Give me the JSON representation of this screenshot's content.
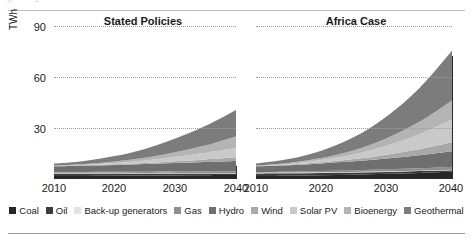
{
  "figure": {
    "ylabel": "TWh",
    "ghost_text": "Figure fragment"
  },
  "legend": {
    "items": [
      {
        "label": "Coal",
        "color": "#262626"
      },
      {
        "label": "Oil",
        "color": "#3d3d3d"
      },
      {
        "label": "Back-up generators",
        "color": "#e2e2e2"
      },
      {
        "label": "Gas",
        "color": "#8e8e8e"
      },
      {
        "label": "Hydro",
        "color": "#6f6f6f"
      },
      {
        "label": "Wind",
        "color": "#a8a8a8"
      },
      {
        "label": "Solar PV",
        "color": "#c9c9c9"
      },
      {
        "label": "Bioenergy",
        "color": "#b4b4b4"
      },
      {
        "label": "Geothermal",
        "color": "#7c7c7c"
      }
    ]
  },
  "chart_data": {
    "type": "area",
    "title": "",
    "xlabel": "",
    "ylabel": "TWh",
    "ylim": [
      0,
      95
    ],
    "yticks": [
      30,
      60,
      90
    ],
    "grid": true,
    "legend_position": "bottom",
    "x": [
      2010,
      2015,
      2020,
      2025,
      2030,
      2035,
      2040
    ],
    "xticks": [
      2010,
      2020,
      2030,
      2040
    ],
    "panels": [
      {
        "name": "Stated Policies",
        "series": [
          {
            "name": "Coal",
            "values": [
              1.2,
              1.3,
              1.4,
              1.5,
              1.6,
              1.7,
              1.8
            ]
          },
          {
            "name": "Oil",
            "values": [
              1.6,
              1.5,
              1.4,
              1.3,
              1.2,
              1.1,
              1.0
            ]
          },
          {
            "name": "Back-up generators",
            "values": [
              0.5,
              0.5,
              0.5,
              0.4,
              0.4,
              0.3,
              0.3
            ]
          },
          {
            "name": "Gas",
            "values": [
              0.4,
              0.5,
              0.6,
              0.7,
              0.8,
              0.9,
              1.0
            ]
          },
          {
            "name": "Hydro",
            "values": [
              3.6,
              3.9,
              4.3,
              4.8,
              5.4,
              6.0,
              6.6
            ]
          },
          {
            "name": "Wind",
            "values": [
              0.1,
              0.2,
              0.4,
              0.7,
              1.1,
              1.6,
              2.2
            ]
          },
          {
            "name": "Solar PV",
            "values": [
              0.1,
              0.3,
              0.8,
              1.6,
              2.8,
              4.2,
              6.0
            ]
          },
          {
            "name": "Bioenergy",
            "values": [
              0.3,
              0.5,
              0.9,
              1.6,
              2.8,
              4.6,
              7.1
            ]
          },
          {
            "name": "Geothermal",
            "values": [
              1.2,
              2.0,
              3.4,
              5.6,
              8.6,
              12.2,
              16.5
            ]
          }
        ],
        "total_2010": 9.0,
        "total_2040": 42.5
      },
      {
        "name": "Africa Case",
        "series": [
          {
            "name": "Coal",
            "values": [
              1.2,
              1.4,
              1.7,
              2.1,
              2.6,
              3.2,
              3.9
            ]
          },
          {
            "name": "Oil",
            "values": [
              1.6,
              1.5,
              1.4,
              1.3,
              1.2,
              1.1,
              1.0
            ]
          },
          {
            "name": "Back-up generators",
            "values": [
              0.5,
              0.5,
              0.5,
              0.4,
              0.4,
              0.3,
              0.3
            ]
          },
          {
            "name": "Gas",
            "values": [
              0.4,
              0.5,
              0.7,
              0.9,
              1.2,
              1.5,
              1.9
            ]
          },
          {
            "name": "Hydro",
            "values": [
              3.6,
              4.1,
              4.8,
              5.7,
              6.8,
              8.1,
              9.6
            ]
          },
          {
            "name": "Wind",
            "values": [
              0.1,
              0.3,
              0.7,
              1.4,
              2.4,
              3.8,
              5.6
            ]
          },
          {
            "name": "Solar PV",
            "values": [
              0.1,
              0.5,
              1.4,
              3.0,
              5.6,
              9.3,
              14.2
            ]
          },
          {
            "name": "Bioenergy",
            "values": [
              0.3,
              0.6,
              1.3,
              2.6,
              4.7,
              7.8,
              12.0
            ]
          },
          {
            "name": "Geothermal",
            "values": [
              1.2,
              2.4,
              4.6,
              8.2,
              13.6,
              21.0,
              31.0
            ]
          }
        ],
        "total_2010": 9.0,
        "total_2040": 79.5
      }
    ]
  },
  "panels_meta": [
    {
      "title": "Stated Policies",
      "xticks": [
        "2010",
        "2020",
        "2030",
        "2040"
      ]
    },
    {
      "title": "Africa Case",
      "xticks": [
        "2010",
        "2020",
        "2030",
        "2040"
      ]
    }
  ],
  "yticks_text": [
    "90",
    "60",
    "30"
  ]
}
